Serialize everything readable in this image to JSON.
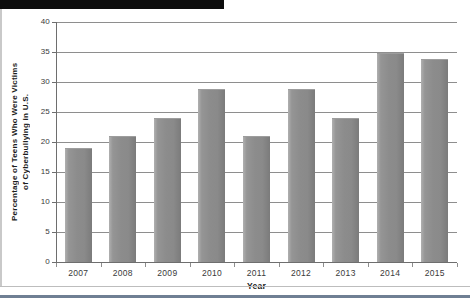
{
  "redaction": {
    "label": "redacted-black-bar"
  },
  "chart_data": {
    "type": "bar",
    "title": "",
    "xlabel": "Year",
    "ylabel_line1": "Percentage of Teens Who Were Victims",
    "ylabel_line2": "of Cyberbullying in U.S.",
    "categories": [
      "2007",
      "2008",
      "2009",
      "2010",
      "2011",
      "2012",
      "2013",
      "2014",
      "2015"
    ],
    "values": [
      19,
      21,
      24,
      28.8,
      21,
      28.8,
      24,
      34.8,
      33.8
    ],
    "ylim": [
      0,
      40
    ],
    "yticks": [
      0,
      5,
      10,
      15,
      20,
      25,
      30,
      35,
      40
    ],
    "ytick_labels": [
      "0",
      "5",
      "10",
      "15",
      "20",
      "25",
      "30",
      "35",
      "40"
    ],
    "grid": true,
    "legend": "none",
    "bar_color": "#8a8a8a",
    "grid_color": "#8e8e8e",
    "axis_color": "#6e6e6e"
  }
}
